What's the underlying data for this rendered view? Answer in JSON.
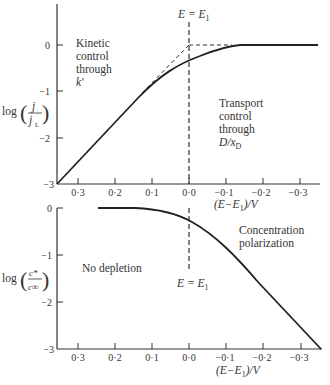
{
  "figure": {
    "top_panel": {
      "ylabel": "log(j / j_L)",
      "ylabel_parts": {
        "log": "log",
        "num": "j",
        "den": "j",
        "den_sub": "L"
      },
      "yticks": [
        "0",
        "−1",
        "−2",
        "−3"
      ],
      "xticks": [
        "0·3",
        "0·2",
        "0·1",
        "0·0",
        "−0·1",
        "−0·2",
        "−0·3"
      ],
      "xlabel": "(E − E₁)/V",
      "xlabel_parts": {
        "open": "(E−E",
        "sub": "1",
        "close": ")/V"
      },
      "vline_label": {
        "main": "E = E",
        "sub": "1"
      },
      "annotations": {
        "kinetic": [
          "Kinetic",
          "control",
          "through",
          "k'"
        ],
        "transport": [
          "Transport",
          "control",
          "through",
          "D/x_D"
        ],
        "transport_last": {
          "main": "D/x",
          "sub": "D"
        }
      }
    },
    "bottom_panel": {
      "ylabel": "log(c* / c∞)",
      "ylabel_parts": {
        "log": "log",
        "num": "c*",
        "den": "c∞"
      },
      "yticks": [
        "0",
        "−1",
        "−2",
        "−3"
      ],
      "xticks": [
        "0·3",
        "0·2",
        "0·1",
        "0·0",
        "−0·1",
        "−0·2",
        "−0·3"
      ],
      "xlabel": "(E − E₁)/V",
      "xlabel_parts": {
        "open": "(E−E",
        "sub": "1",
        "close": ")/V"
      },
      "vline_label": {
        "main": "E = E",
        "sub": "1"
      },
      "annotations": {
        "no_depletion": "No depletion",
        "concentration": [
          "Concentration",
          "polarization"
        ]
      }
    }
  }
}
